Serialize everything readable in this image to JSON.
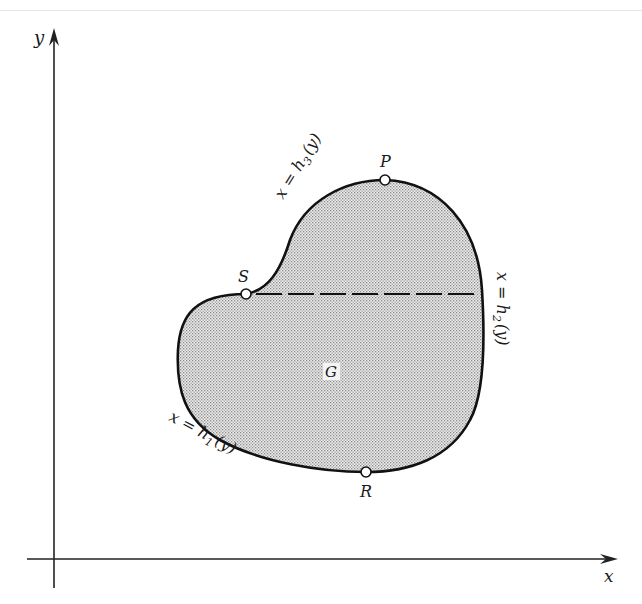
{
  "axes": {
    "x_label": "x",
    "y_label": "y"
  },
  "region": {
    "label": "G",
    "fill_color": "#d9d9d9",
    "stroke_color": "#111111"
  },
  "points": {
    "P": {
      "label": "P",
      "x": 385,
      "y": 180
    },
    "S": {
      "label": "S",
      "x": 246,
      "y": 294
    },
    "R": {
      "label": "R",
      "x": 366,
      "y": 472
    }
  },
  "curves": {
    "h1": {
      "prefix": "x = h",
      "sub": "1",
      "suffix": "(y)"
    },
    "h2": {
      "prefix": "x = h",
      "sub": "2",
      "suffix": "(y)"
    },
    "h3": {
      "prefix": "x = h",
      "sub": "3",
      "suffix": "(y)"
    }
  }
}
